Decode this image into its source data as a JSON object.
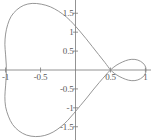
{
  "chart_data": {
    "type": "line",
    "title": "",
    "subtitle": "",
    "xlabel": "",
    "ylabel": "",
    "xlim": [
      -1.08,
      1.08
    ],
    "ylim": [
      -1.85,
      1.85
    ],
    "grid": false,
    "legend": null,
    "axes": {
      "x_axis_at_y": 0,
      "y_axis_at_x": 0,
      "axis_color": "#777777",
      "curve_color": "#8a8a8a",
      "curve_width": 0.9
    },
    "xticks": [
      {
        "value": -1,
        "label": "-1"
      },
      {
        "value": -0.5,
        "label": "-0.5"
      },
      {
        "value": 0.5,
        "label": "0.5"
      },
      {
        "value": 1,
        "label": "1"
      }
    ],
    "yticks": [
      {
        "value": 1.5,
        "label": "1.5"
      },
      {
        "value": 1,
        "label": "1"
      },
      {
        "value": 0.5,
        "label": "0.5"
      },
      {
        "value": -0.5,
        "label": "-0.5"
      },
      {
        "value": -1,
        "label": "-1"
      },
      {
        "value": -1.5,
        "label": "-1.5"
      }
    ],
    "series": [
      {
        "name": "curve",
        "closed": true,
        "self_intersection": [
          0.5,
          0
        ],
        "points": [
          [
            0.5,
            0.0
          ],
          [
            0.42,
            0.2
          ],
          [
            0.33,
            0.41
          ],
          [
            0.24,
            0.62
          ],
          [
            0.15,
            0.83
          ],
          [
            0.06,
            1.03
          ],
          [
            -0.03,
            1.22
          ],
          [
            -0.13,
            1.4
          ],
          [
            -0.24,
            1.55
          ],
          [
            -0.36,
            1.67
          ],
          [
            -0.49,
            1.74
          ],
          [
            -0.62,
            1.76
          ],
          [
            -0.74,
            1.71
          ],
          [
            -0.84,
            1.59
          ],
          [
            -0.92,
            1.42
          ],
          [
            -0.97,
            1.2
          ],
          [
            -1.0,
            0.95
          ],
          [
            -1.01,
            0.68
          ],
          [
            -1.0,
            0.4
          ],
          [
            -0.99,
            0.13
          ],
          [
            -0.99,
            -0.15
          ],
          [
            -1.0,
            -0.42
          ],
          [
            -1.01,
            -0.7
          ],
          [
            -1.0,
            -0.97
          ],
          [
            -0.96,
            -1.22
          ],
          [
            -0.9,
            -1.44
          ],
          [
            -0.81,
            -1.61
          ],
          [
            -0.7,
            -1.72
          ],
          [
            -0.57,
            -1.76
          ],
          [
            -0.44,
            -1.73
          ],
          [
            -0.32,
            -1.64
          ],
          [
            -0.21,
            -1.5
          ],
          [
            -0.11,
            -1.33
          ],
          [
            -0.02,
            -1.14
          ],
          [
            0.07,
            -0.94
          ],
          [
            0.16,
            -0.74
          ],
          [
            0.25,
            -0.53
          ],
          [
            0.34,
            -0.33
          ],
          [
            0.43,
            -0.14
          ],
          [
            0.5,
            0.0
          ],
          [
            0.58,
            0.12
          ],
          [
            0.67,
            0.21
          ],
          [
            0.76,
            0.27
          ],
          [
            0.85,
            0.28
          ],
          [
            0.93,
            0.23
          ],
          [
            0.99,
            0.13
          ],
          [
            1.01,
            0.0
          ],
          [
            0.99,
            -0.13
          ],
          [
            0.93,
            -0.23
          ],
          [
            0.85,
            -0.28
          ],
          [
            0.76,
            -0.27
          ],
          [
            0.67,
            -0.21
          ],
          [
            0.58,
            -0.12
          ],
          [
            0.5,
            0.0
          ]
        ]
      }
    ]
  }
}
